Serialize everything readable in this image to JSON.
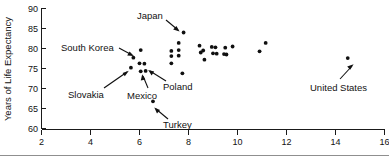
{
  "chart_data": {
    "type": "scatter",
    "title": "",
    "xlabel": "",
    "ylabel": "Years of Life Expectancy",
    "xlim": [
      2,
      16
    ],
    "ylim": [
      60,
      90
    ],
    "xticks": [
      2,
      4,
      6,
      8,
      10,
      12,
      14,
      16
    ],
    "yticks": [
      60,
      65,
      70,
      75,
      80,
      85,
      90
    ],
    "grid": false,
    "legend": "none",
    "points": [
      {
        "x": 5.65,
        "y": 75.2
      },
      {
        "x": 5.75,
        "y": 77.7
      },
      {
        "x": 6.05,
        "y": 79.6
      },
      {
        "x": 6.0,
        "y": 76.3
      },
      {
        "x": 6.05,
        "y": 74.3
      },
      {
        "x": 6.2,
        "y": 76.2
      },
      {
        "x": 6.25,
        "y": 74.4
      },
      {
        "x": 6.55,
        "y": 66.8
      },
      {
        "x": 7.3,
        "y": 79.4
      },
      {
        "x": 7.3,
        "y": 78.1
      },
      {
        "x": 7.3,
        "y": 76.3
      },
      {
        "x": 7.6,
        "y": 81.4
      },
      {
        "x": 7.6,
        "y": 79.6
      },
      {
        "x": 7.6,
        "y": 78.2
      },
      {
        "x": 7.75,
        "y": 73.8
      },
      {
        "x": 7.8,
        "y": 84.0
      },
      {
        "x": 8.45,
        "y": 80.7
      },
      {
        "x": 8.5,
        "y": 79.0
      },
      {
        "x": 8.6,
        "y": 79.5
      },
      {
        "x": 8.65,
        "y": 77.2
      },
      {
        "x": 8.95,
        "y": 80.4
      },
      {
        "x": 9.0,
        "y": 78.8
      },
      {
        "x": 9.1,
        "y": 80.3
      },
      {
        "x": 9.15,
        "y": 78.7
      },
      {
        "x": 9.45,
        "y": 78.6
      },
      {
        "x": 9.5,
        "y": 80.2
      },
      {
        "x": 9.55,
        "y": 78.5
      },
      {
        "x": 9.8,
        "y": 80.5
      },
      {
        "x": 10.9,
        "y": 79.3
      },
      {
        "x": 11.15,
        "y": 81.4
      },
      {
        "x": 14.5,
        "y": 77.6
      }
    ],
    "annotations": [
      {
        "label": "Japan",
        "point_x": 7.8,
        "point_y": 84.0
      },
      {
        "label": "South Korea",
        "point_x": 5.75,
        "point_y": 77.7
      },
      {
        "label": "Slovakia",
        "point_x": 5.65,
        "point_y": 75.2
      },
      {
        "label": "Mexico",
        "point_x": 6.05,
        "point_y": 74.3
      },
      {
        "label": "Poland",
        "point_x": 6.2,
        "point_y": 76.2
      },
      {
        "label": "Turkey",
        "point_x": 6.55,
        "point_y": 66.8
      },
      {
        "label": "United States",
        "point_x": 14.5,
        "point_y": 77.6
      }
    ]
  },
  "axis": {
    "y_title": "Years of Life Expectancy",
    "y_tick_labels": [
      "90",
      "85",
      "80",
      "75",
      "70",
      "65",
      "60"
    ],
    "x_tick_labels": [
      "2",
      "4",
      "6",
      "8",
      "10",
      "12",
      "14",
      "16"
    ]
  },
  "labels": {
    "japan": "Japan",
    "south_korea": "South Korea",
    "slovakia": "Slovakia",
    "mexico": "Mexico",
    "poland": "Poland",
    "turkey": "Turkey",
    "united_states": "United States"
  },
  "colors": {
    "point": "#101010",
    "axis": "#1a1a1a",
    "text": "#121212",
    "background": "#ffffff"
  }
}
